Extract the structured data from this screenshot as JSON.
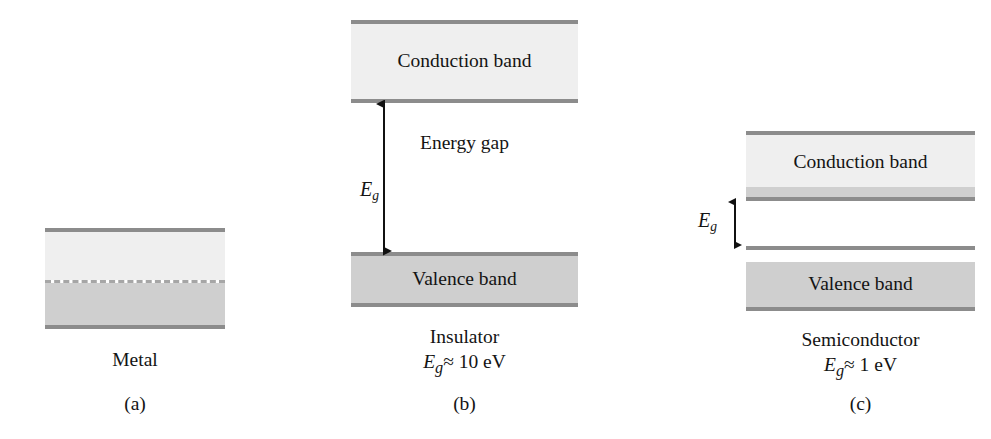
{
  "panels": {
    "metal": {
      "letter": "(a)",
      "name": "Metal",
      "bands": {
        "upper_empty_label": "",
        "lower_filled_label": ""
      }
    },
    "insulator": {
      "letter": "(b)",
      "name": "Insulator",
      "gap_value": "Eg ≈ 10 eV",
      "gap_symbol": "E",
      "gap_subscript": "g",
      "gap_relation": "≈ 10 eV",
      "conduction_band_label": "Conduction band",
      "valence_band_label": "Valence band",
      "energy_gap_label": "Energy gap"
    },
    "semiconductor": {
      "letter": "(c)",
      "name": "Semiconductor",
      "gap_value": "Eg ≈ 1 eV",
      "gap_symbol": "E",
      "gap_subscript": "g",
      "gap_relation": "≈ 1 eV",
      "conduction_band_label": "Conduction band",
      "valence_band_label": "Valence band"
    }
  },
  "colors": {
    "edge": "#8c8c8c",
    "fill_light": "#efefef",
    "fill_mid": "#e2e2e2",
    "fill_dark": "#cfcfcf",
    "text": "#141414",
    "background": "#ffffff"
  }
}
